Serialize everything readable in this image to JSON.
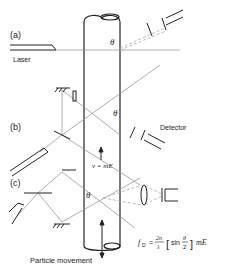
{
  "labels": {
    "panel_a": "(a)",
    "panel_b": "(b)",
    "panel_c": "(c)",
    "laser": "Laser",
    "detector": "Detector",
    "theta": "θ",
    "velocity": "v = mE",
    "particle_movement": "Particle movement"
  },
  "formula": {
    "lhs": "f",
    "lhs_sub": "D",
    "equals": "=",
    "num": "2n",
    "den": "λ",
    "sin": "sin",
    "theta_num": "θ",
    "theta_den": "2",
    "rhs": "mE"
  },
  "colors": {
    "line": "#222222",
    "beam": "#999999",
    "dashed": "#aaaaaa"
  }
}
